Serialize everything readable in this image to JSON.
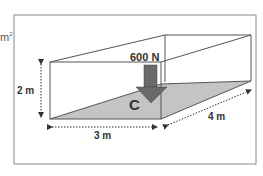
{
  "fragment": {
    "text": "m",
    "sup": "2"
  },
  "diagram": {
    "force_label": "600 N",
    "point_label": "C",
    "height_label": "2 m",
    "width_label": "3 m",
    "depth_label": "4 m"
  },
  "colors": {
    "frame": "#8a8a8a",
    "edges": "#555555",
    "floor": "#c4c4c4",
    "arrow": "#6a6a6a",
    "dims": "#333333"
  }
}
